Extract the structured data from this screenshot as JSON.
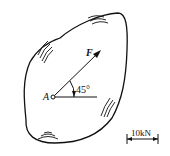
{
  "diagram": {
    "point_label": "A",
    "force_label": "F",
    "angle_label": "45°",
    "scale_label": "10kN",
    "colors": {
      "stroke": "#111111",
      "background": "#ffffff"
    }
  }
}
